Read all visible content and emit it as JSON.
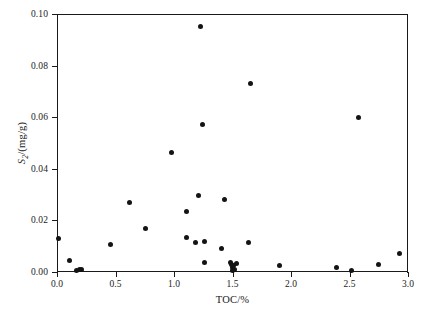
{
  "chart_data": {
    "type": "scatter",
    "title": "",
    "xlabel": "TOC/%",
    "ylabel": "S2/(mg/g)",
    "ylabel_base": "S",
    "ylabel_sub": "2",
    "ylabel_rest": "/(mg/g)",
    "xlim": [
      0.0,
      3.0
    ],
    "ylim": [
      0.0,
      0.1
    ],
    "grid": false,
    "legend": null,
    "marker": "filled-circle",
    "marker_color": "#141414",
    "xticks": [
      0.0,
      0.5,
      1.0,
      1.5,
      2.0,
      2.5,
      3.0
    ],
    "xticklabels": [
      "0.0",
      "0.5",
      "1.0",
      "1.5",
      "2.0",
      "2.5",
      "3.0"
    ],
    "yticks": [
      0.0,
      0.02,
      0.04,
      0.06,
      0.08,
      0.1
    ],
    "yticklabels": [
      "0.00",
      "0.02",
      "0.04",
      "0.06",
      "0.08",
      "0.10"
    ],
    "x": [
      0.01,
      0.11,
      0.17,
      0.19,
      0.21,
      0.46,
      0.62,
      0.76,
      0.98,
      1.11,
      1.11,
      1.18,
      1.21,
      1.23,
      1.24,
      1.26,
      1.26,
      1.41,
      1.43,
      1.48,
      1.49,
      1.5,
      1.5,
      1.51,
      1.52,
      1.53,
      1.64,
      1.65,
      1.9,
      2.39,
      2.52,
      2.58,
      2.75,
      2.93
    ],
    "y": [
      0.013,
      0.0043,
      0.0007,
      0.0008,
      0.0009,
      0.0105,
      0.027,
      0.017,
      0.0465,
      0.0233,
      0.0135,
      0.0113,
      0.0298,
      0.095,
      0.057,
      0.012,
      0.0035,
      0.0093,
      0.028,
      0.0037,
      0.0029,
      0.0016,
      0.0005,
      0.0024,
      0.0009,
      0.0033,
      0.0113,
      0.073,
      0.0026,
      0.0016,
      0.0004,
      0.06,
      0.0029,
      0.007
    ],
    "n_points": 34
  }
}
